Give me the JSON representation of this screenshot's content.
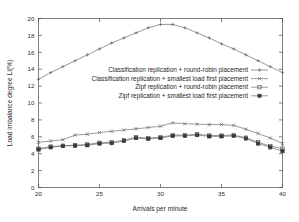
{
  "chart_data": {
    "type": "line",
    "title": "",
    "xlabel": "Arrivals per minute",
    "ylabel": "Load imbalance degree LI(%)",
    "xlim": [
      20,
      40
    ],
    "ylim": [
      0,
      20
    ],
    "xticks": [
      20,
      25,
      30,
      35,
      40
    ],
    "yticks": [
      0,
      2,
      4,
      6,
      8,
      10,
      12,
      14,
      16,
      18,
      20
    ],
    "grid": false,
    "legend_position": "center",
    "x": [
      20,
      21,
      22,
      23,
      24,
      25,
      26,
      27,
      28,
      29,
      30,
      31,
      32,
      33,
      34,
      35,
      36,
      37,
      38,
      39,
      40
    ],
    "series": [
      {
        "name": "Classification replication + round-robin placement",
        "marker": "plus",
        "values": [
          12.8,
          13.6,
          14.3,
          15.0,
          15.7,
          16.4,
          17.1,
          17.7,
          18.3,
          18.9,
          19.3,
          19.3,
          18.9,
          18.3,
          17.7,
          17.0,
          16.4,
          15.7,
          15.0,
          14.3,
          13.6
        ]
      },
      {
        "name": "Classification replication + smallest load first placement",
        "marker": "cross",
        "values": [
          5.35,
          5.5,
          5.65,
          6.2,
          6.3,
          6.5,
          6.65,
          6.8,
          6.95,
          7.1,
          7.25,
          7.65,
          7.55,
          7.5,
          7.45,
          7.45,
          7.35,
          6.9,
          6.4,
          5.85,
          5.2
        ]
      },
      {
        "name": "Zipf replication + round-robin placement",
        "marker": "square",
        "values": [
          4.6,
          4.85,
          4.95,
          5.0,
          5.1,
          5.3,
          5.35,
          5.6,
          5.95,
          5.85,
          5.95,
          6.2,
          6.2,
          6.3,
          6.15,
          6.15,
          6.2,
          5.9,
          5.35,
          4.9,
          4.6
        ]
      },
      {
        "name": "Zipf replication + smallest load first placement",
        "marker": "filled-square",
        "values": [
          4.5,
          4.75,
          4.9,
          4.95,
          5.0,
          5.2,
          5.25,
          5.5,
          5.85,
          5.75,
          5.85,
          6.1,
          6.1,
          6.2,
          6.05,
          6.05,
          6.1,
          5.8,
          5.2,
          4.75,
          4.3
        ]
      }
    ]
  },
  "colors": {
    "axis": "#4a4a4a",
    "series": "#555555",
    "text": "#1f1f1f",
    "background": "#ffffff"
  }
}
